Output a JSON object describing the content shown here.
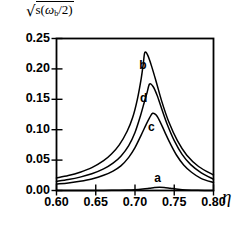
{
  "chart_data": {
    "type": "line",
    "title": "",
    "ylabel": "√s(ω_b/2)",
    "ylabel_parts": {
      "radical": "√",
      "body_s": "s(",
      "omega": "ω",
      "sub_b": "b",
      "tail": "/2)"
    },
    "xlabel": "η",
    "xlim": [
      0.6,
      0.8
    ],
    "ylim": [
      0.0,
      0.25
    ],
    "xticks": [
      0.6,
      0.65,
      0.7,
      0.75,
      0.8
    ],
    "xtick_labels": [
      "0.60",
      "0.65",
      "0.70",
      "0.75",
      "0.80"
    ],
    "yticks": [
      0.0,
      0.05,
      0.1,
      0.15,
      0.2,
      0.25
    ],
    "ytick_labels": [
      "0.00",
      "0.05",
      "0.10",
      "0.15",
      "0.20",
      "0.25"
    ],
    "grid": false,
    "legend_position": "inline-curve-labels",
    "line_color": "#000000",
    "series": [
      {
        "name": "a",
        "label": "a",
        "label_x": 0.7295,
        "label_y": 0.0185,
        "peak_x": 0.731,
        "peak_y": 0.0055,
        "x": [
          0.6,
          0.62,
          0.64,
          0.66,
          0.675,
          0.69,
          0.7,
          0.71,
          0.718,
          0.725,
          0.731,
          0.737,
          0.745,
          0.755,
          0.765,
          0.78,
          0.8
        ],
        "values": [
          0.0,
          0.0,
          0.0001,
          0.0002,
          0.0004,
          0.0008,
          0.0014,
          0.0025,
          0.0037,
          0.0049,
          0.0055,
          0.0051,
          0.0038,
          0.0021,
          0.001,
          0.0003,
          0.0
        ]
      },
      {
        "name": "c",
        "label": "c",
        "label_x": 0.7215,
        "label_y": 0.102,
        "peak_x": 0.7225,
        "peak_y": 0.127,
        "x": [
          0.6,
          0.615,
          0.63,
          0.645,
          0.66,
          0.672,
          0.682,
          0.692,
          0.7,
          0.708,
          0.714,
          0.7185,
          0.7225,
          0.727,
          0.732,
          0.738,
          0.745,
          0.753,
          0.762,
          0.772,
          0.784,
          0.8
        ],
        "values": [
          0.0105,
          0.0125,
          0.0152,
          0.019,
          0.025,
          0.032,
          0.0405,
          0.0545,
          0.0705,
          0.0915,
          0.108,
          0.1195,
          0.127,
          0.124,
          0.113,
          0.096,
          0.077,
          0.058,
          0.042,
          0.03,
          0.02,
          0.013
        ]
      },
      {
        "name": "d",
        "label": "d",
        "label_x": 0.7115,
        "label_y": 0.151,
        "peak_x": 0.7185,
        "peak_y": 0.175,
        "x": [
          0.6,
          0.615,
          0.63,
          0.645,
          0.66,
          0.672,
          0.682,
          0.692,
          0.7,
          0.707,
          0.712,
          0.7155,
          0.7185,
          0.723,
          0.728,
          0.734,
          0.741,
          0.75,
          0.76,
          0.771,
          0.784,
          0.8
        ],
        "values": [
          0.015,
          0.018,
          0.022,
          0.0275,
          0.0355,
          0.045,
          0.0565,
          0.074,
          0.0955,
          0.123,
          0.146,
          0.1615,
          0.175,
          0.171,
          0.157,
          0.1345,
          0.109,
          0.082,
          0.0595,
          0.0425,
          0.0295,
          0.0185
        ]
      },
      {
        "name": "b",
        "label": "b",
        "label_x": 0.7105,
        "label_y": 0.204,
        "peak_x": 0.7125,
        "peak_y": 0.227,
        "x": [
          0.6,
          0.615,
          0.63,
          0.645,
          0.66,
          0.67,
          0.68,
          0.69,
          0.697,
          0.703,
          0.708,
          0.7105,
          0.7125,
          0.716,
          0.721,
          0.727,
          0.734,
          0.743,
          0.754,
          0.766,
          0.781,
          0.8
        ],
        "values": [
          0.0205,
          0.0245,
          0.03,
          0.0375,
          0.049,
          0.06,
          0.075,
          0.0975,
          0.12,
          0.15,
          0.185,
          0.208,
          0.227,
          0.223,
          0.205,
          0.179,
          0.147,
          0.113,
          0.082,
          0.058,
          0.0395,
          0.0255
        ]
      }
    ]
  }
}
